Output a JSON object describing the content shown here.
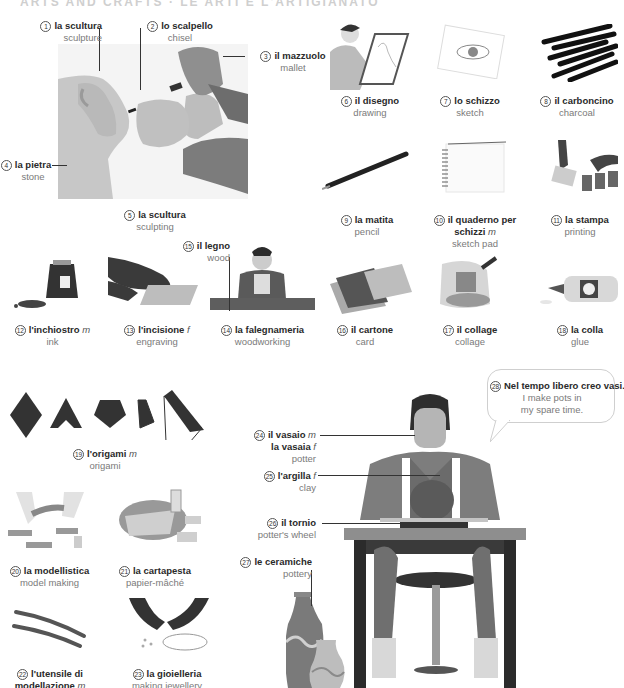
{
  "header": {
    "partial_title": "ARTS AND CRAFTS · LE ARTI E L'ARTIGIANATO"
  },
  "entries": [
    {
      "n": "1",
      "it": "la scultura",
      "en": "sculpture"
    },
    {
      "n": "2",
      "it": "lo scalpello",
      "en": "chisel"
    },
    {
      "n": "3",
      "it": "il mazzuolo",
      "en": "mallet"
    },
    {
      "n": "4",
      "it": "la pietra",
      "en": "stone"
    },
    {
      "n": "5",
      "it": "la scultura",
      "en": "sculpting"
    },
    {
      "n": "6",
      "it": "il disegno",
      "en": "drawing"
    },
    {
      "n": "7",
      "it": "lo schizzo",
      "en": "sketch"
    },
    {
      "n": "8",
      "it": "il carboncino",
      "en": "charcoal"
    },
    {
      "n": "9",
      "it": "la matita",
      "en": "pencil"
    },
    {
      "n": "10",
      "it": "il quaderno per",
      "it2": "schizzi",
      "g": "m",
      "en": "sketch pad"
    },
    {
      "n": "11",
      "it": "la stampa",
      "en": "printing"
    },
    {
      "n": "12",
      "it": "l'inchiostro",
      "g": "m",
      "en": "ink"
    },
    {
      "n": "13",
      "it": "l'incisione",
      "g": "f",
      "en": "engraving"
    },
    {
      "n": "14",
      "it": "la falegnameria",
      "en": "woodworking"
    },
    {
      "n": "15",
      "it": "il legno",
      "en": "wood"
    },
    {
      "n": "16",
      "it": "il cartone",
      "en": "card"
    },
    {
      "n": "17",
      "it": "il collage",
      "en": "collage"
    },
    {
      "n": "18",
      "it": "la colla",
      "en": "glue"
    },
    {
      "n": "19",
      "it": "l'origami",
      "g": "m",
      "en": "origami"
    },
    {
      "n": "20",
      "it": "la modellistica",
      "en": "model making"
    },
    {
      "n": "21",
      "it": "la cartapesta",
      "en": "papier-mâché"
    },
    {
      "n": "22",
      "it": "l'utensile di",
      "it2": "modellazione",
      "g": "m",
      "en": ""
    },
    {
      "n": "23",
      "it": "la gioielleria",
      "en": "making jewellery"
    },
    {
      "n": "24",
      "it": "il vasaio",
      "g": "m",
      "it2": "la vasaia",
      "g2": "f",
      "en": "potter"
    },
    {
      "n": "25",
      "it": "l'argilla",
      "g": "f",
      "en": "clay"
    },
    {
      "n": "26",
      "it": "il tornio",
      "en": "potter's wheel"
    },
    {
      "n": "27",
      "it": "le ceramiche",
      "en": "pottery"
    },
    {
      "n": "28",
      "it": "Nel tempo libero creo vasi.",
      "en": "I make pots in",
      "en2": "my spare time."
    }
  ],
  "colors": {
    "illustration_dark": "#3a3a3a",
    "illustration_mid": "#8a8a8a",
    "illustration_light": "#c8c8c8",
    "text_gray": "#7a7a7a"
  }
}
